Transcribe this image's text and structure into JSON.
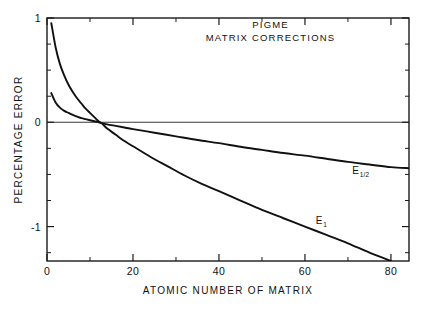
{
  "figure": {
    "background": "#ffffff",
    "ink_color": "#111111"
  },
  "chart_data": {
    "type": "line",
    "title": "",
    "annotations": [
      {
        "text": "PIGME",
        "x": 52,
        "y": 0.9
      },
      {
        "text": "MATRIX CORRECTIONS",
        "x": 52,
        "y": 0.78
      }
    ],
    "xlabel": "ATOMIC NUMBER OF MATRIX",
    "ylabel": "PERCENTAGE ERROR",
    "xlim": [
      0,
      84.2
    ],
    "ylim": [
      -1.33,
      1.0
    ],
    "grid": false,
    "legend_position": "inline-curve-labels",
    "x_major_ticks": [
      0,
      20,
      40,
      60,
      80
    ],
    "x_major_tick_labels": [
      "0",
      "20",
      "40",
      "60",
      "80"
    ],
    "x_minor_ticks": [
      10,
      30,
      50,
      70
    ],
    "y_major_ticks": [
      1,
      0,
      -1
    ],
    "y_major_tick_labels": [
      "1",
      "0",
      "-1"
    ],
    "y_minor_ticks": [
      0.75,
      0.5,
      0.25,
      -0.25,
      -0.5,
      -0.75,
      -1.25
    ],
    "zero_reference_line": 0,
    "series": [
      {
        "name": "E_1",
        "label_text": "E",
        "label_subscript": "1",
        "label_x": 62.5,
        "label_y": -0.98,
        "x": [
          1.0,
          2.0,
          3.0,
          4.0,
          5.0,
          6.0,
          7.0,
          8.0,
          9.0,
          10.0,
          11.0,
          12.0,
          13.0,
          14.0,
          16.0,
          18.0,
          20.0,
          24.0,
          28.0,
          32.0,
          36.0,
          40.0,
          45.0,
          50.0,
          55.0,
          60.0,
          65.0,
          70.0,
          75.0,
          80.0
        ],
        "y": [
          0.95,
          0.72,
          0.56,
          0.45,
          0.36,
          0.29,
          0.23,
          0.18,
          0.13,
          0.09,
          0.05,
          0.01,
          -0.02,
          -0.06,
          -0.12,
          -0.18,
          -0.23,
          -0.33,
          -0.42,
          -0.51,
          -0.59,
          -0.66,
          -0.75,
          -0.84,
          -0.92,
          -1.0,
          -1.08,
          -1.16,
          -1.25,
          -1.33
        ]
      },
      {
        "name": "E_1/2",
        "label_text": "E",
        "label_subscript": "1/2",
        "label_x": 71.0,
        "label_y": -0.5,
        "x": [
          1.0,
          2.0,
          3.0,
          4.0,
          5.0,
          6.0,
          7.0,
          8.0,
          9.0,
          10.0,
          11.0,
          12.0,
          13.0,
          14.0,
          16.0,
          18.0,
          20.0,
          25.0,
          30.0,
          35.0,
          40.0,
          45.0,
          50.0,
          55.0,
          60.0,
          65.0,
          70.0,
          75.0,
          80.0,
          84.2
        ],
        "y": [
          0.28,
          0.19,
          0.14,
          0.11,
          0.09,
          0.07,
          0.055,
          0.04,
          0.03,
          0.02,
          0.01,
          0.0,
          -0.01,
          -0.02,
          -0.035,
          -0.05,
          -0.065,
          -0.1,
          -0.135,
          -0.17,
          -0.2,
          -0.235,
          -0.265,
          -0.295,
          -0.32,
          -0.35,
          -0.38,
          -0.405,
          -0.43,
          -0.44
        ]
      }
    ]
  }
}
